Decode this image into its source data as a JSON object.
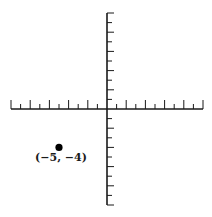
{
  "diagram": {
    "type": "coordinate-plane",
    "x_range": [
      -10,
      10
    ],
    "y_range": [
      -10,
      10
    ],
    "axis_color": "#1a1a1a",
    "point_color": "#000000"
  },
  "chart_data": {
    "type": "scatter",
    "title": "",
    "xlabel": "",
    "ylabel": "",
    "xlim": [
      -10,
      10
    ],
    "ylim": [
      -10,
      10
    ],
    "grid": false,
    "points": [
      {
        "x": -5,
        "y": -4,
        "label": "(−5, −4)"
      }
    ]
  },
  "points": [
    {
      "x": -5,
      "y": -4,
      "label": "(−5, −4)"
    }
  ]
}
